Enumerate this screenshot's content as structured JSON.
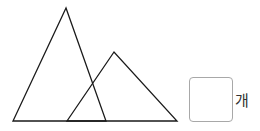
{
  "figure": {
    "stroke_color": "#1a1a1a",
    "large_triangle": {
      "points": [
        [
          66,
          8
        ],
        [
          13,
          121
        ],
        [
          106,
          121
        ]
      ]
    },
    "small_triangle": {
      "points": [
        [
          114,
          52
        ],
        [
          67,
          121
        ],
        [
          177,
          121
        ]
      ]
    }
  },
  "answer": {
    "value": "",
    "unit": "개",
    "border_color": "#a8a8a8"
  }
}
